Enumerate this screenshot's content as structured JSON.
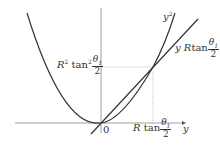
{
  "diagram": {
    "curves": {
      "parabola_label": "y",
      "parabola_label_exp": "2",
      "line_label_var": "y",
      "line_label_coef": "R",
      "line_label_fn": "tan"
    },
    "axes": {
      "x_axis_label": "y",
      "origin_label": "0"
    },
    "intersection": {
      "x_label_coef": "R",
      "x_label_fn": "tan",
      "y_label_coef": "R",
      "y_label_coef_exp": "2",
      "y_label_fn": "tan",
      "y_label_fn_exp": "2"
    },
    "fraction": {
      "numerator": "θ",
      "numerator_sub": "1",
      "denominator": "2"
    },
    "colors": {
      "curve": "#333333",
      "axis": "#888888",
      "guide": "#999999"
    }
  }
}
